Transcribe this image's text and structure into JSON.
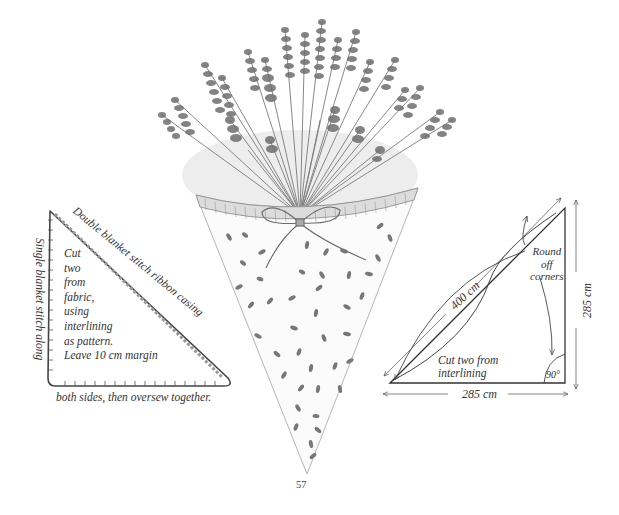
{
  "page": {
    "number": "57",
    "illustration": {
      "subject": "Lavender bouquet in a fabric cone with ribbon bow",
      "fabric_pattern": "scattered lavender seeds",
      "colors": {
        "ink": "#3a3a3a",
        "light_ink": "#8a8a8a",
        "paper": "#ffffff"
      }
    },
    "left_diagram": {
      "top_edge_label": "Double blanket stitch ribbon casing",
      "left_edge_label": "Single blanket stitch along",
      "bottom_edge_label": "both sides, then oversew together.",
      "instructions": [
        "Cut",
        "two",
        "from",
        "fabric,",
        "using",
        "interlining",
        "as pattern.",
        "Leave 10 cm margin"
      ]
    },
    "right_diagram": {
      "hypotenuse_label": "400 cm",
      "vertical_label": "285 cm",
      "horizontal_label": "285 cm",
      "round_note": [
        "Round",
        "off",
        "corners"
      ],
      "cut_note": [
        "Cut two from",
        "interlining"
      ],
      "angle_label": "90°"
    }
  }
}
